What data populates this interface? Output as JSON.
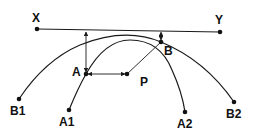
{
  "diagram": {
    "type": "geometric-construction",
    "colors": {
      "line": "#1a1a1a",
      "background": "#ffffff"
    },
    "line_xy": {
      "start": {
        "label": "X",
        "x": 37,
        "y": 29
      },
      "end": {
        "label": "Y",
        "x": 220,
        "y": 32
      }
    },
    "points": {
      "A": {
        "label": "A",
        "x": 86,
        "y": 74
      },
      "B": {
        "label": "B",
        "x": 161,
        "y": 42
      },
      "P": {
        "label": "P",
        "x": 127,
        "y": 74
      },
      "A1": {
        "label": "A1",
        "x": 69,
        "y": 110
      },
      "A2": {
        "label": "A2",
        "x": 185,
        "y": 112
      },
      "B1": {
        "label": "B1",
        "x": 19,
        "y": 99
      },
      "B2": {
        "label": "B2",
        "x": 234,
        "y": 102
      }
    },
    "curves": [
      {
        "name": "curve-A1-A2",
        "from": "A1",
        "to": "A2",
        "passes_through": "A"
      },
      {
        "name": "curve-B1-B2",
        "from": "B1",
        "to": "B2",
        "passes_through": "B"
      }
    ],
    "arrows": [
      {
        "name": "arrow-A-to-XY",
        "description": "vertical double arrow from A to line XY"
      },
      {
        "name": "arrow-B-to-XY",
        "description": "short vertical dashed arrow from B to line XY"
      },
      {
        "name": "arrow-A-to-P",
        "description": "horizontal double arrow between A and P"
      },
      {
        "name": "line-P-to-B",
        "description": "line from P to B"
      }
    ]
  }
}
